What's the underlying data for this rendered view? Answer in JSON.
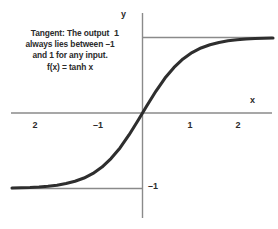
{
  "annotation": {
    "line1": "Tangent: The output",
    "line2": "always lies between –1",
    "line3": "and 1 for any input.",
    "line4": "f(x) = tanh x"
  },
  "axes": {
    "y_label": "y",
    "x_label": "x"
  },
  "chart_data": {
    "type": "line",
    "title": "",
    "xlabel": "x",
    "ylabel": "y",
    "xlim": [
      -2.9,
      2.9
    ],
    "ylim": [
      -1.45,
      1.45
    ],
    "grid": false,
    "legend": "none",
    "annotations": [
      "Tangent: The output",
      "always lies between –1",
      "and 1 for any input.",
      "f(x) = tanh x"
    ],
    "xticks": [
      -2,
      -1,
      1,
      2
    ],
    "xticklabels": [
      "2",
      "–1",
      "1",
      "2"
    ],
    "yticks": [
      1,
      -1
    ],
    "yticklabels": [
      "1",
      "–1"
    ],
    "series": [
      {
        "name": "f(x) = tanh x",
        "color": "#2e2e2e",
        "x": [
          -2.9,
          -2.7,
          -2.5,
          -2.3,
          -2.1,
          -1.9,
          -1.7,
          -1.5,
          -1.3,
          -1.1,
          -0.9,
          -0.7,
          -0.5,
          -0.3,
          -0.1,
          0,
          0.1,
          0.3,
          0.5,
          0.7,
          0.9,
          1.1,
          1.3,
          1.5,
          1.7,
          1.9,
          2.1,
          2.3,
          2.5,
          2.7,
          2.9
        ],
        "values": [
          -0.994,
          -0.991,
          -0.987,
          -0.98,
          -0.97,
          -0.956,
          -0.935,
          -0.905,
          -0.862,
          -0.8,
          -0.716,
          -0.604,
          -0.462,
          -0.291,
          -0.1,
          0,
          0.1,
          0.291,
          0.462,
          0.604,
          0.716,
          0.8,
          0.862,
          0.905,
          0.935,
          0.956,
          0.97,
          0.98,
          0.987,
          0.991,
          0.994
        ]
      }
    ],
    "reference_lines": [
      {
        "name": "upper-asymptote",
        "y": 1,
        "color": "#8a8a8a"
      },
      {
        "name": "lower-asymptote",
        "y": -1,
        "color": "#8a8a8a"
      }
    ]
  },
  "colors": {
    "background": "#ffffff",
    "curve": "#2e2e2e",
    "axis": "#8a8a8a",
    "text": "#2b2b2b"
  }
}
